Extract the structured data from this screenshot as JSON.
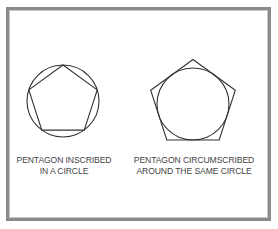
{
  "figures": [
    {
      "id": "inscribed",
      "caption_line1": "PENTAGON INSCRIBED",
      "caption_line2": "IN A CIRCLE",
      "circle": {
        "cx": 63,
        "cy": 101,
        "r": 36
      },
      "pentagon_radius": 36
    },
    {
      "id": "circumscribed",
      "caption_line1": "PENTAGON CIRCUMSCRIBED",
      "caption_line2": "AROUND THE SAME CIRCLE",
      "circle": {
        "cx": 193,
        "cy": 104,
        "r": 36
      },
      "pentagon_radius": 44.5
    }
  ],
  "colors": {
    "stroke": "#333333",
    "frame": "#8a8a8a",
    "text": "#444444"
  }
}
